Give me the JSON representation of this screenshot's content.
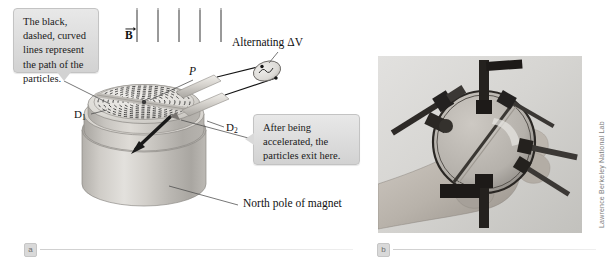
{
  "figure": {
    "panels": [
      {
        "letter": "a",
        "caption_type": "diagram"
      },
      {
        "letter": "b",
        "caption_type": "photograph"
      }
    ],
    "credit": "Lawrence Berkeley National Lab"
  },
  "callouts": [
    {
      "id": "path-callout",
      "text": "The black, dashed, curved lines represent the path of the particles."
    },
    {
      "id": "exit-callout",
      "text": "After being accelerated, the particles exit here."
    }
  ],
  "labels": {
    "b_field": "B",
    "dee_1": "D",
    "dee_1_sub": "1",
    "dee_2": "D",
    "dee_2_sub": "2",
    "source_point": "P",
    "alternating_voltage": "Alternating ΔV",
    "magnet_pole": "North pole of magnet"
  },
  "colors": {
    "page_background": "#ffffff",
    "callout_fill": "#dcdcdc",
    "callout_border": "#c3c3c3",
    "ink": "#101010",
    "magnet_body": "#c9c6c2",
    "dee_top": "#d7d5d1",
    "rule": "#d5d5d5",
    "chip_text": "#6d6d6d",
    "photo_background": "#cfcfcf"
  }
}
